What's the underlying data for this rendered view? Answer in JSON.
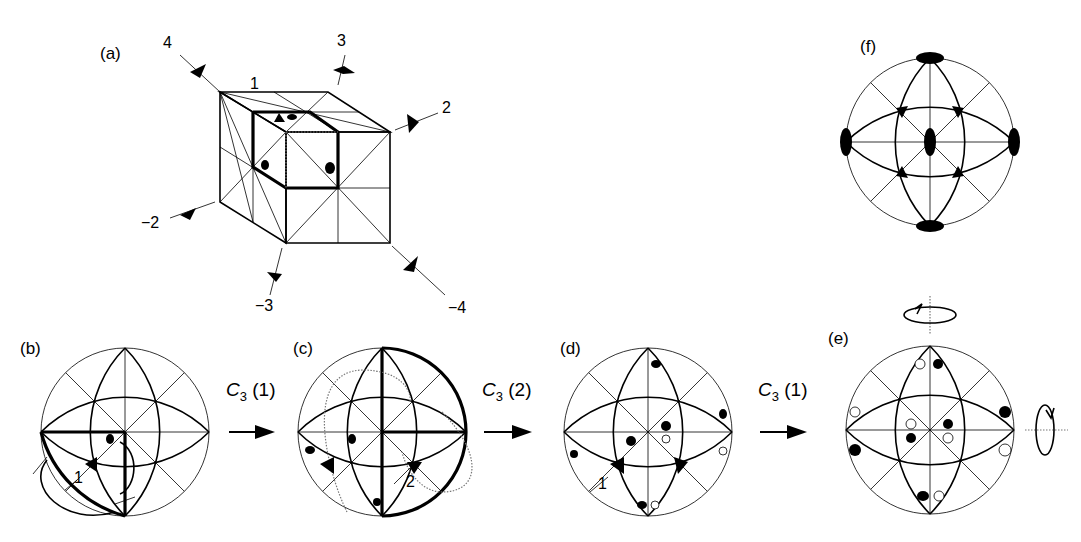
{
  "figure": {
    "panels": {
      "a": {
        "label": "(a)",
        "axis_labels": [
          "1",
          "2",
          "3",
          "4",
          "−2",
          "−3",
          "−4"
        ]
      },
      "b": {
        "label": "(b)",
        "marker_label": "1"
      },
      "c": {
        "label": "(c)",
        "marker_label": "2"
      },
      "d": {
        "label": "(d)",
        "marker_label": "1"
      },
      "e": {
        "label": "(e)"
      },
      "f": {
        "label": "(f)"
      }
    },
    "operations": [
      {
        "symbol": "C",
        "sub": "3",
        "arg": "(1)"
      },
      {
        "symbol": "C",
        "sub": "3",
        "arg": "(2)"
      },
      {
        "symbol": "C",
        "sub": "3",
        "arg": "(1)"
      }
    ]
  }
}
